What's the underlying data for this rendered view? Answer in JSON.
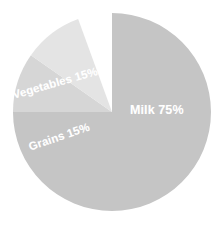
{
  "chart_data": {
    "type": "pie",
    "title": "",
    "subtitle": "",
    "xlabel": "",
    "ylabel": "",
    "legend_position": "none",
    "grid": false,
    "labels_inside_slices": true,
    "background_color": "#ffffff",
    "center": {
      "x": 112,
      "y": 112
    },
    "radius": 99,
    "categories": [
      "Milk",
      "Vegetables",
      "Grains"
    ],
    "values": [
      75,
      15,
      15
    ],
    "units": "percent",
    "slices": [
      {
        "name": "Milk",
        "value": 75,
        "percent_text": "75%",
        "label": "Milk 75%",
        "color": "#c5c5c5",
        "start_angle": 180,
        "end_angle": 450,
        "label_rotation": 0
      },
      {
        "name": "Vegetables",
        "value": 15,
        "percent_text": "15%",
        "label": "Vegetables 15%",
        "color": "#d6d6d6",
        "start_angle": 145,
        "end_angle": 180,
        "label_rotation": -16
      },
      {
        "name": "Grains",
        "value": 15,
        "percent_text": "15%",
        "label": "Grains 15%",
        "color": "#e4e4e4",
        "start_angle": 110,
        "end_angle": 145,
        "label_rotation": -19
      }
    ]
  },
  "labels": {
    "milk": "Milk 75%",
    "vegetables": "Vegetables 15%",
    "grains": "Grains 15%"
  }
}
